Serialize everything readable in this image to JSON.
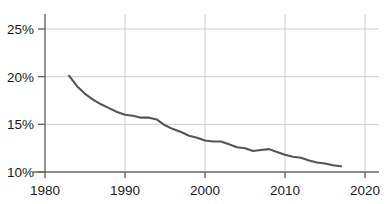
{
  "chart_data": {
    "type": "line",
    "title": "",
    "subtitle": "",
    "xlabel": "",
    "ylabel": "",
    "xlim": [
      1980,
      2020
    ],
    "ylim": [
      10,
      25
    ],
    "grid": true,
    "legend": false,
    "legend_position": "none",
    "line_color": "#555555",
    "grid_color": "#cccccc",
    "axis_color": "#666666",
    "background_color": "#ffffff",
    "x_tick_labels": [
      "1980",
      "1990",
      "2000",
      "2010",
      "2020"
    ],
    "x_ticks": [
      1980,
      1990,
      2000,
      2010,
      2020
    ],
    "y_tick_labels": [
      "10%",
      "15%",
      "20%",
      "25%"
    ],
    "y_ticks": [
      10,
      15,
      20,
      25
    ],
    "series": [
      {
        "name": "",
        "x": [
          1983,
          1984,
          1985,
          1986,
          1987,
          1988,
          1989,
          1990,
          1991,
          1992,
          1993,
          1994,
          1995,
          1996,
          1997,
          1998,
          1999,
          2000,
          2001,
          2002,
          2003,
          2004,
          2005,
          2006,
          2007,
          2008,
          2009,
          2010,
          2011,
          2012,
          2013,
          2014,
          2015,
          2016,
          2017
        ],
        "values": [
          20.1,
          19.0,
          18.2,
          17.6,
          17.1,
          16.7,
          16.3,
          16.0,
          15.9,
          15.7,
          15.7,
          15.5,
          14.9,
          14.5,
          14.2,
          13.8,
          13.6,
          13.3,
          13.2,
          13.2,
          12.9,
          12.6,
          12.5,
          12.2,
          12.3,
          12.4,
          12.1,
          11.8,
          11.6,
          11.5,
          11.2,
          11.0,
          10.9,
          10.7,
          10.6
        ]
      }
    ]
  }
}
